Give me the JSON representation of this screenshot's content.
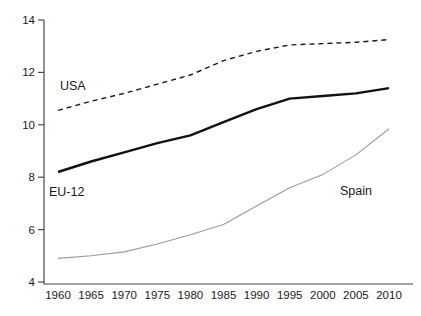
{
  "chart_data": {
    "type": "line",
    "title": "",
    "xlabel": "",
    "ylabel": "",
    "x": [
      1960,
      1965,
      1970,
      1975,
      1980,
      1985,
      1990,
      1995,
      2000,
      2005,
      2010
    ],
    "series": [
      {
        "name": "USA",
        "values": [
          10.55,
          10.9,
          11.2,
          11.55,
          11.9,
          12.45,
          12.8,
          13.05,
          13.1,
          13.15,
          13.25
        ],
        "line_style": "dashed",
        "color": "#1a1a1a",
        "stroke_width": 1.4,
        "label": "USA",
        "label_x": 60,
        "label_y": 90
      },
      {
        "name": "EU-12",
        "values": [
          8.2,
          8.6,
          8.95,
          9.3,
          9.6,
          10.1,
          10.6,
          11.0,
          11.1,
          11.2,
          11.4
        ],
        "line_style": "solid",
        "color": "#111111",
        "stroke_width": 2.4,
        "label": "EU-12",
        "label_x": 49,
        "label_y": 196
      },
      {
        "name": "Spain",
        "values": [
          4.9,
          5.0,
          5.15,
          5.45,
          5.8,
          6.2,
          6.9,
          7.6,
          8.1,
          8.85,
          9.85
        ],
        "line_style": "solid",
        "color": "#9a9a9a",
        "stroke_width": 1.1,
        "label": "Spain",
        "label_x": 340,
        "label_y": 195
      }
    ],
    "ylim": [
      4,
      14
    ],
    "yticks": [
      4,
      6,
      8,
      10,
      12,
      14
    ],
    "xticks": [
      1960,
      1965,
      1970,
      1975,
      1980,
      1985,
      1990,
      1995,
      2000,
      2005,
      2010
    ],
    "grid": false,
    "legend_position": "inline-labels",
    "axis_color": "#4a4a4a",
    "background_color": "#ffffff"
  }
}
